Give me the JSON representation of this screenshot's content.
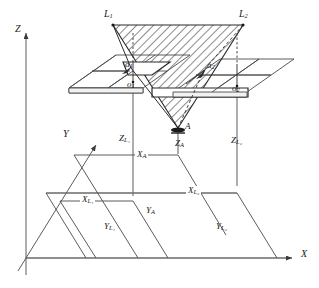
{
  "figure": {
    "type": "technical-line-diagram",
    "background_color": "#ffffff",
    "line_color": "#3a3a3a",
    "hatch_color": "#2b2b2b"
  },
  "axes": {
    "z": {
      "label": "Z",
      "x": 17,
      "y": 26,
      "arrow_tip": [
        26,
        31
      ],
      "origin": [
        26,
        258
      ]
    },
    "y": {
      "label": "Y",
      "x": 64,
      "y": 130,
      "arrow_tip": [
        98,
        141
      ],
      "origin": [
        26,
        258
      ]
    },
    "x": {
      "label": "X",
      "x": 301,
      "y": 250,
      "arrow_tip": [
        296,
        256
      ],
      "origin": [
        26,
        258
      ]
    }
  },
  "points": {
    "L1": {
      "label": "L",
      "sub": "1",
      "x": 104,
      "y": 10,
      "pos": [
        113,
        25
      ]
    },
    "L2": {
      "label": "L",
      "sub": "2",
      "x": 239,
      "y": 10,
      "pos": [
        243,
        25
      ]
    },
    "A": {
      "label": "A",
      "sub": "",
      "x": 184,
      "y": 124,
      "pos": [
        178,
        129
      ]
    },
    "o1": {
      "label": "o",
      "sub": "1",
      "x": 128,
      "y": 80,
      "pos": [
        133,
        82
      ]
    },
    "o2": {
      "label": "o",
      "sub": "2",
      "x": 232,
      "y": 85,
      "pos": [
        237,
        86
      ]
    },
    "a1": {
      "label": "a",
      "sub": "1",
      "x": 124,
      "y": 62,
      "pos": [
        131,
        68
      ]
    },
    "a2": {
      "label": "a",
      "sub": "2",
      "x": 207,
      "y": 62,
      "pos": [
        204,
        70
      ]
    }
  },
  "ground_labels": [
    {
      "name": "Z_L1",
      "base": "Z",
      "sub": "L₁",
      "x": 119,
      "y": 135
    },
    {
      "name": "Z_A",
      "base": "Z",
      "sub": "A",
      "x": 176,
      "y": 140
    },
    {
      "name": "Z_L2",
      "base": "Z",
      "sub": "L₂",
      "x": 231,
      "y": 137
    },
    {
      "name": "X_A",
      "base": "X",
      "sub": "A",
      "x": 135,
      "y": 157
    },
    {
      "name": "X_L2",
      "base": "X",
      "sub": "L₂",
      "x": 186,
      "y": 188
    },
    {
      "name": "X_L1",
      "base": "X",
      "sub": "L₁",
      "x": 80,
      "y": 201
    },
    {
      "name": "Y_A",
      "base": "Y",
      "sub": "A",
      "x": 146,
      "y": 210
    },
    {
      "name": "Y_L1",
      "base": "Y",
      "sub": "L₁",
      "x": 104,
      "y": 227
    },
    {
      "name": "Y_L2",
      "base": "Y",
      "sub": "L₂",
      "x": 216,
      "y": 227
    }
  ],
  "image_planes": [
    {
      "name": "left-image-plane",
      "center": "o1"
    },
    {
      "name": "right-image-plane",
      "center": "o2"
    }
  ],
  "hatched_region": {
    "name": "epipolar-triangle",
    "vertices": [
      "L1",
      "L2",
      "A"
    ],
    "fill": "diagonal-hatch"
  }
}
